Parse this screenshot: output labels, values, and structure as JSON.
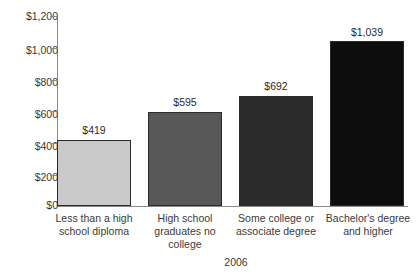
{
  "chart_data": {
    "type": "bar",
    "title": "",
    "subtitle": "",
    "xlabel": "",
    "ylabel": "",
    "period_label": "2006",
    "ylim": [
      0,
      1200
    ],
    "ytick_labels": [
      "$1,200",
      "$1,000",
      "$800",
      "$600",
      "$400",
      "$200",
      "$0"
    ],
    "ytick_values": [
      1200,
      1000,
      800,
      600,
      400,
      200,
      0
    ],
    "grid": false,
    "legend": "none",
    "categories": [
      "Less than a high school diploma",
      "High school graduates no college",
      "Some college or associate degree",
      "Bachelor's degree and higher"
    ],
    "category_lines": [
      [
        "Less than a high",
        "school diploma"
      ],
      [
        "High school",
        "graduates no",
        "college"
      ],
      [
        "Some college or",
        "associate degree"
      ],
      [
        "Bachelor's degree",
        "and higher"
      ]
    ],
    "values": [
      419,
      595,
      692,
      1039
    ],
    "value_labels": [
      "$419",
      "$595",
      "$692",
      "$1,039"
    ],
    "bar_colors": [
      "#c9c9c9",
      "#585858",
      "#2a2a2a",
      "#0d0d0d"
    ],
    "bar_border_color": "#2b2b2b",
    "axis_color": "#8a8a8a",
    "text_color": "#3a3a3a",
    "background": "#ffffff"
  }
}
